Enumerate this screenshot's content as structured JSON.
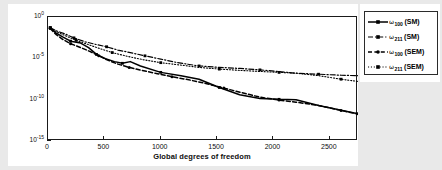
{
  "chart_data": {
    "type": "line",
    "title": "",
    "xlabel": "Global degrees of freedom",
    "ylabel": "Relative error",
    "xlim": [
      0,
      2750
    ],
    "ylim": [
      1e-15,
      1.0
    ],
    "yscale": "log",
    "xscale": "linear",
    "grid": false,
    "legend_position": "right-outside",
    "xticks": [
      0,
      500,
      1000,
      1500,
      2000,
      2500
    ],
    "xtick_labels": [
      "0",
      "500",
      "1000",
      "1500",
      "2000",
      "2500"
    ],
    "yticks": [
      1.0,
      1e-05,
      1e-10,
      1e-15
    ],
    "ytick_labels": [
      "10",
      "10",
      "10",
      "10"
    ],
    "ytick_exponents": [
      "0",
      "-5",
      "-10",
      "-15"
    ],
    "series": [
      {
        "name": "omega_100_SM",
        "label_symbol": "ω",
        "label_sub": "100",
        "label_method": "(SM)",
        "linestyle": "solid",
        "color": "#000000",
        "marker": "square",
        "x": [
          20,
          70,
          130,
          200,
          290,
          360,
          430,
          510,
          590,
          660,
          730,
          820,
          1000,
          1180,
          1340,
          1520,
          1700,
          1880,
          2050,
          2200,
          2400,
          2750
        ],
        "y": [
          0.05,
          0.012,
          0.004,
          0.0012,
          0.0007,
          0.0002,
          3e-05,
          9e-06,
          4e-06,
          2.5e-06,
          4e-06,
          1.2e-06,
          2e-07,
          8e-08,
          3e-08,
          3e-09,
          4e-10,
          1.4e-10,
          1.1e-10,
          1e-10,
          2e-11,
          2e-12
        ]
      },
      {
        "name": "omega_211_SM",
        "label_symbol": "ω",
        "label_sub": "211",
        "label_method": "(SM)",
        "linestyle": "dashdot",
        "color": "#000000",
        "marker": "square",
        "x": [
          20,
          80,
          150,
          230,
          330,
          420,
          520,
          620,
          730,
          860,
          1000,
          1150,
          1340,
          1520,
          1700,
          1880,
          2050,
          2200,
          2400,
          2600,
          2750
        ],
        "y": [
          0.05,
          0.02,
          0.009,
          0.003,
          0.001,
          0.0005,
          0.00025,
          0.0001,
          5e-05,
          2e-05,
          8e-06,
          3e-06,
          1.2e-06,
          8e-07,
          6e-07,
          4e-07,
          2.5e-07,
          1.6e-07,
          1.2e-07,
          9e-08,
          8e-08
        ]
      },
      {
        "name": "omega_100_SEM",
        "label_symbol": "ω",
        "label_sub": "100",
        "label_method": "(SEM)",
        "linestyle": "dashed",
        "color": "#000000",
        "marker": "circle",
        "x": [
          20,
          70,
          130,
          200,
          290,
          370,
          450,
          530,
          620,
          720,
          830,
          960,
          1100,
          1250,
          1400,
          1560,
          1720,
          1880,
          2050,
          2200,
          2400,
          2600,
          2750
        ],
        "y": [
          0.04,
          0.008,
          0.002,
          0.0006,
          0.0002,
          7e-05,
          2e-05,
          6e-06,
          2e-06,
          8e-07,
          3.5e-07,
          1.5e-07,
          6e-08,
          2.5e-08,
          9e-09,
          2.5e-09,
          7e-10,
          2e-10,
          9e-11,
          5e-11,
          2e-11,
          5e-12,
          1.8e-12
        ]
      },
      {
        "name": "omega_211_SEM",
        "label_symbol": "ω",
        "label_sub": "211",
        "label_method": "(SEM)",
        "linestyle": "dotted",
        "color": "#000000",
        "marker": "square",
        "x": [
          20,
          80,
          160,
          250,
          350,
          460,
          570,
          700,
          840,
          1000,
          1180,
          1340,
          1520,
          1700,
          1880,
          2050,
          2200,
          2400,
          2600,
          2750
        ],
        "y": [
          0.05,
          0.015,
          0.005,
          0.0015,
          0.0005,
          0.00015,
          5e-05,
          1.8e-05,
          7e-06,
          3e-06,
          1.5e-06,
          8e-07,
          5e-07,
          3.5e-07,
          2.6e-07,
          2e-07,
          1.6e-07,
          8e-08,
          3e-08,
          1.6e-08
        ]
      }
    ]
  }
}
